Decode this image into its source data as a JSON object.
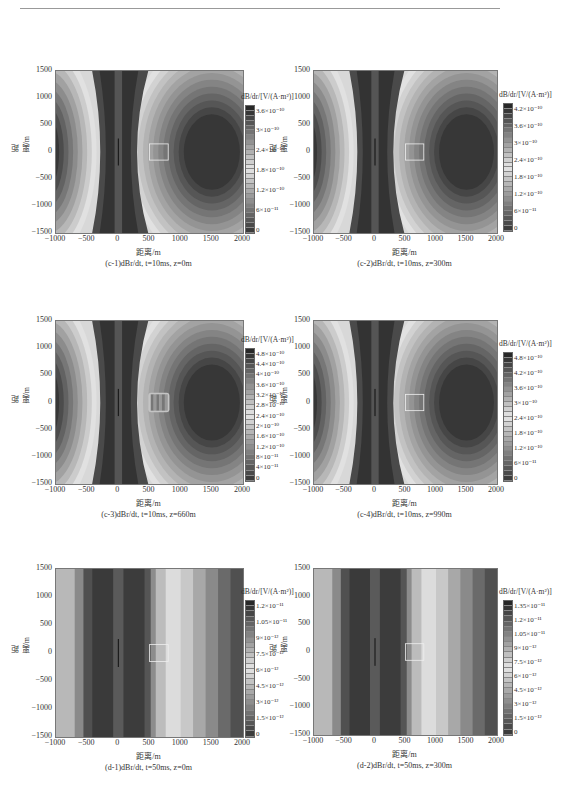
{
  "page": {
    "header_rule": true
  },
  "axes_common": {
    "ylabel": "距离/m",
    "xlabel": "距离/m",
    "yticks": [
      "1500",
      "1000",
      "500",
      "0",
      "−500",
      "−1000",
      "−1500"
    ],
    "xticks": [
      "−1000",
      "−500",
      "0",
      "500",
      "1000",
      "1500",
      "2000"
    ],
    "cbar_title": "dB/dr/[V/(A·m²)]"
  },
  "panels": [
    {
      "id": "c-1",
      "caption": "(c-1)dBr/dt, t=10ms, z=0m",
      "cbar_ticks": [
        "3.6×10⁻¹⁰",
        "3×10⁻¹⁰",
        "2.4×10⁻¹⁰",
        "1.8×10⁻¹⁰",
        "1.2×10⁻¹⁰",
        "6×10⁻¹¹",
        "0"
      ]
    },
    {
      "id": "c-2",
      "caption": "(c-2)dBr/dt, t=10ms, z=300m",
      "cbar_ticks": [
        "4.2×10⁻¹⁰",
        "3.6×10⁻¹⁰",
        "3×10⁻¹⁰",
        "2.4×10⁻¹⁰",
        "1.8×10⁻¹⁰",
        "1.2×10⁻¹⁰",
        "6×10⁻¹¹",
        "0"
      ]
    },
    {
      "id": "c-3",
      "caption": "(c-3)dBr/dt, t=10ms, z=660m",
      "cbar_ticks": [
        "4.8×10⁻¹⁰",
        "4.4×10⁻¹⁰",
        "4×10⁻¹⁰",
        "3.6×10⁻¹⁰",
        "3.2×10⁻¹⁰",
        "2.8×10⁻¹⁰",
        "2.4×10⁻¹⁰",
        "2×10⁻¹⁰",
        "1.6×10⁻¹⁰",
        "1.2×10⁻¹⁰",
        "8×10⁻¹¹",
        "4×10⁻¹¹",
        "0"
      ]
    },
    {
      "id": "c-4",
      "caption": "(c-4)dBr/dt, t=10ms, z=990m",
      "cbar_ticks": [
        "4.8×10⁻¹⁰",
        "4.2×10⁻¹⁰",
        "3.6×10⁻¹⁰",
        "3×10⁻¹⁰",
        "2.4×10⁻¹⁰",
        "1.8×10⁻¹⁰",
        "1.2×10⁻¹⁰",
        "6×10⁻¹¹",
        "0"
      ]
    },
    {
      "id": "d-1",
      "caption": "(d-1)dBr/dt, t=50ms, z=0m",
      "cbar_ticks": [
        "1.2×10⁻¹¹",
        "1.05×10⁻¹¹",
        "9×10⁻¹²",
        "7.5×10⁻¹²",
        "6×10⁻¹²",
        "4.5×10⁻¹²",
        "3×10⁻¹²",
        "1.5×10⁻¹²",
        "0"
      ]
    },
    {
      "id": "d-2",
      "caption": "(d-2)dBr/dt, t=50ms, z=300m",
      "cbar_ticks": [
        "1.35×10⁻¹¹",
        "1.2×10⁻¹¹",
        "1.05×10⁻¹¹",
        "9×10⁻¹²",
        "7.5×10⁻¹²",
        "6×10⁻¹²",
        "4.5×10⁻¹²",
        "3×10⁻¹²",
        "1.5×10⁻¹²",
        "0"
      ]
    }
  ],
  "chart_data": [
    {
      "type": "heatmap",
      "title": "(c-1)dBr/dt, t=10ms, z=0m",
      "xlabel": "距离/m",
      "ylabel": "距离/m",
      "xlim": [
        -1000,
        2000
      ],
      "ylim": [
        -1500,
        1500
      ],
      "colorbar_label": "dB/dr/[V/(A·m²)]",
      "colorbar_range": [
        0,
        3.6e-10
      ]
    },
    {
      "type": "heatmap",
      "title": "(c-2)dBr/dt, t=10ms, z=300m",
      "xlabel": "距离/m",
      "ylabel": "距离/m",
      "xlim": [
        -1000,
        2000
      ],
      "ylim": [
        -1500,
        1500
      ],
      "colorbar_label": "dB/dr/[V/(A·m²)]",
      "colorbar_range": [
        0,
        4.2e-10
      ]
    },
    {
      "type": "heatmap",
      "title": "(c-3)dBr/dt, t=10ms, z=660m",
      "xlabel": "距离/m",
      "ylabel": "距离/m",
      "xlim": [
        -1000,
        2000
      ],
      "ylim": [
        -1500,
        1500
      ],
      "colorbar_label": "dB/dr/[V/(A·m²)]",
      "colorbar_range": [
        0,
        4.8e-10
      ]
    },
    {
      "type": "heatmap",
      "title": "(c-4)dBr/dt, t=10ms, z=990m",
      "xlabel": "距离/m",
      "ylabel": "距离/m",
      "xlim": [
        -1000,
        2000
      ],
      "ylim": [
        -1500,
        1500
      ],
      "colorbar_label": "dB/dr/[V/(A·m²)]",
      "colorbar_range": [
        0,
        4.8e-10
      ]
    },
    {
      "type": "heatmap",
      "title": "(d-1)dBr/dt, t=50ms, z=0m",
      "xlabel": "距离/m",
      "ylabel": "距离/m",
      "xlim": [
        -1000,
        2000
      ],
      "ylim": [
        -1500,
        1500
      ],
      "colorbar_label": "dB/dr/[V/(A·m²)]",
      "colorbar_range": [
        0,
        1.2e-11
      ]
    },
    {
      "type": "heatmap",
      "title": "(d-2)dBr/dt, t=50ms, z=300m",
      "xlabel": "距离/m",
      "ylabel": "距离/m",
      "xlim": [
        -1000,
        2000
      ],
      "ylim": [
        -1500,
        1500
      ],
      "colorbar_label": "dB/dr/[V/(A·m²)]",
      "colorbar_range": [
        0,
        1.35e-11
      ]
    }
  ]
}
